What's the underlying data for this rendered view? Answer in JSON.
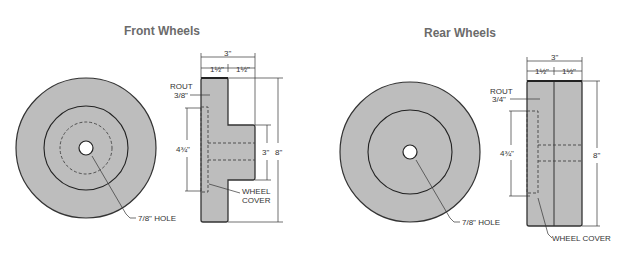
{
  "front": {
    "title": "Front Wheels",
    "face_view": {
      "hole_label": "7/8\" HOLE"
    },
    "side_view": {
      "overall_width": "3\"",
      "half_left": "1½\"",
      "half_right": "1½\"",
      "rout_label": "ROUT",
      "rout_value": "3/8\"",
      "cover_height": "4¾\"",
      "hub_height": "3\"",
      "diameter": "8\"",
      "cover_label_1": "WHEEL",
      "cover_label_2": "COVER"
    }
  },
  "rear": {
    "title": "Rear Wheels",
    "face_view": {
      "hole_label": "7/8\" HOLE"
    },
    "side_view": {
      "overall_width": "3\"",
      "half_left": "1½\"",
      "half_right": "1½\"",
      "rout_label": "ROUT",
      "rout_value": "3/4\"",
      "cover_height": "4¾\"",
      "diameter": "8\"",
      "cover_label": "WHEEL COVER"
    }
  },
  "colors": {
    "wood": "#bdbdbd",
    "line": "#222222",
    "title": "#6b6b6b"
  }
}
